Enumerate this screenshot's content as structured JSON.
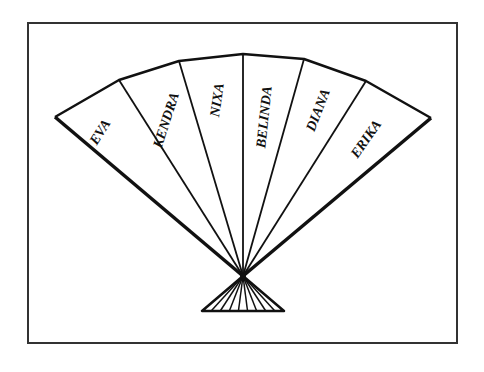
{
  "diagram": {
    "type": "folding-fan",
    "frame": {
      "x": 28,
      "y": 23,
      "width": 429,
      "height": 320
    },
    "pivot": {
      "x": 243,
      "y": 276
    },
    "outer_points": [
      [
        55,
        117
      ],
      [
        119,
        80
      ],
      [
        179,
        61
      ],
      [
        243,
        54
      ],
      [
        304,
        59
      ],
      [
        366,
        81
      ],
      [
        431,
        118
      ]
    ],
    "base": {
      "left": [
        202,
        311
      ],
      "right": [
        284,
        311
      ]
    },
    "stroke_color": "#111111",
    "frame_color": "#333333",
    "panels": [
      {
        "label": "EVA",
        "cx": 100,
        "cy": 132,
        "angle": -58
      },
      {
        "label": "KENDRA",
        "cx": 166,
        "cy": 120,
        "angle": -72
      },
      {
        "label": "NIXA",
        "cx": 217,
        "cy": 100,
        "angle": -82
      },
      {
        "label": "BELINDA",
        "cx": 264,
        "cy": 117,
        "angle": -84
      },
      {
        "label": "DIANA",
        "cx": 318,
        "cy": 110,
        "angle": -69
      },
      {
        "label": "ERIKA",
        "cx": 366,
        "cy": 139,
        "angle": -55
      }
    ]
  }
}
